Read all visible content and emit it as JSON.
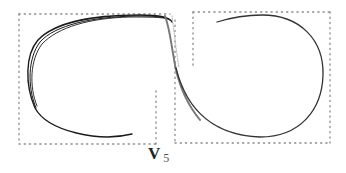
{
  "figure": {
    "label_main": "V",
    "label_sub": "5",
    "colors": {
      "curve": "#1a1a1a",
      "dotted_border": "#888888",
      "background": "#ffffff"
    }
  }
}
